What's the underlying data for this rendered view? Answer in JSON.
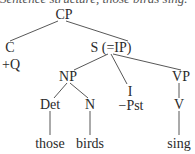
{
  "caption": "Sentence structure, those birds sing.",
  "tree": {
    "nodes": {
      "cp": "CP",
      "c": "C",
      "c_feature": "+Q",
      "s": "S (=IP)",
      "np": "NP",
      "i": "I",
      "i_feature": "−Pst",
      "vp": "VP",
      "det": "Det",
      "n": "N",
      "v": "V",
      "w_those": "those",
      "w_birds": "birds",
      "w_sing": "sing"
    },
    "edges": [
      [
        "CP",
        "C"
      ],
      [
        "CP",
        "S (=IP)"
      ],
      [
        "S (=IP)",
        "NP"
      ],
      [
        "S (=IP)",
        "I"
      ],
      [
        "S (=IP)",
        "VP"
      ],
      [
        "NP",
        "Det"
      ],
      [
        "NP",
        "N"
      ],
      [
        "VP",
        "V"
      ],
      [
        "Det",
        "those"
      ],
      [
        "N",
        "birds"
      ],
      [
        "V",
        "sing"
      ]
    ]
  }
}
